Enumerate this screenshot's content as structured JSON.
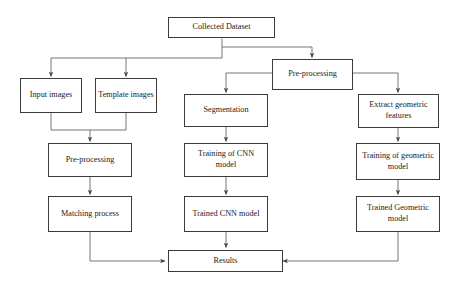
{
  "diagram": {
    "type": "flowchart",
    "width": 461,
    "height": 285,
    "line_color": "#555555",
    "border_color": "#3b3b3b",
    "background_color": "#ffffff",
    "text_color": "#1a1a1a",
    "nodes": [
      {
        "id": "collected_dataset",
        "label": "Collected Dataset"
      },
      {
        "id": "input_images",
        "label": "Input images"
      },
      {
        "id": "template_images",
        "label": "Template images"
      },
      {
        "id": "preprocessing_left",
        "label": "Pre-processing"
      },
      {
        "id": "matching_process",
        "label": "Matching process"
      },
      {
        "id": "preprocessing_right",
        "label": "Pre-processing"
      },
      {
        "id": "segmentation",
        "label": "Segmentation"
      },
      {
        "id": "training_cnn",
        "label": "Training of CNN model"
      },
      {
        "id": "trained_cnn",
        "label": "Trained CNN model"
      },
      {
        "id": "extract_geometric",
        "label": "Extract geometric features"
      },
      {
        "id": "training_geometric",
        "label": "Training of geometric model"
      },
      {
        "id": "trained_geometric",
        "label": "Trained Geometric model"
      },
      {
        "id": "results",
        "label": "Results"
      }
    ],
    "edges": [
      {
        "from": "collected_dataset",
        "to": "input_images"
      },
      {
        "from": "collected_dataset",
        "to": "template_images"
      },
      {
        "from": "collected_dataset",
        "to": "preprocessing_right"
      },
      {
        "from": "input_images",
        "to": "preprocessing_left"
      },
      {
        "from": "template_images",
        "to": "preprocessing_left"
      },
      {
        "from": "preprocessing_left",
        "to": "matching_process"
      },
      {
        "from": "matching_process",
        "to": "results"
      },
      {
        "from": "preprocessing_right",
        "to": "segmentation"
      },
      {
        "from": "preprocessing_right",
        "to": "extract_geometric"
      },
      {
        "from": "segmentation",
        "to": "training_cnn"
      },
      {
        "from": "training_cnn",
        "to": "trained_cnn"
      },
      {
        "from": "trained_cnn",
        "to": "results"
      },
      {
        "from": "extract_geometric",
        "to": "training_geometric"
      },
      {
        "from": "training_geometric",
        "to": "trained_geometric"
      },
      {
        "from": "trained_geometric",
        "to": "results"
      }
    ]
  }
}
